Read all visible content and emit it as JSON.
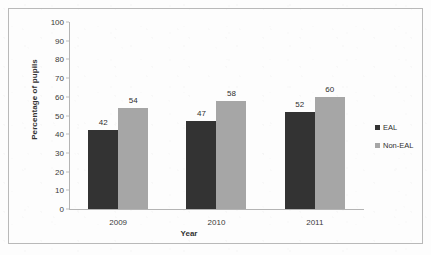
{
  "chart_data": {
    "type": "bar",
    "title": "",
    "subtitle": "",
    "xlabel": "Year",
    "ylabel": "Percentage of pupils",
    "categories": [
      "2009",
      "2010",
      "2011"
    ],
    "series": [
      {
        "name": "EAL",
        "values": [
          42,
          47,
          52
        ],
        "color": "#333333"
      },
      {
        "name": "Non-EAL",
        "values": [
          54,
          58,
          60
        ],
        "color": "#a6a6a6"
      }
    ],
    "ylim": [
      0,
      100
    ],
    "ytick_step": 10,
    "yticks": [
      "0",
      "10",
      "20",
      "30",
      "40",
      "50",
      "60",
      "70",
      "80",
      "90",
      "100"
    ],
    "grid": false,
    "data_labels": true,
    "legend_position": "right"
  },
  "legend": {
    "items": [
      {
        "label": "EAL",
        "color": "#333333"
      },
      {
        "label": "Non-EAL",
        "color": "#a6a6a6"
      }
    ]
  },
  "axes": {
    "y_title": "Percentage of pupils",
    "x_title": "Year"
  }
}
